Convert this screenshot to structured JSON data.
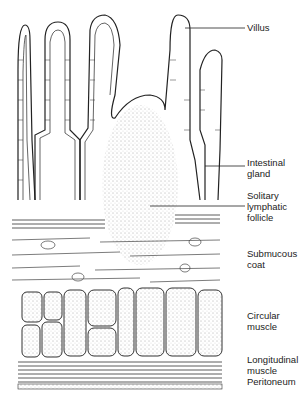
{
  "figure": {
    "labels": [
      {
        "id": "villus",
        "text": "Villus",
        "x": 247,
        "y": 24
      },
      {
        "id": "intestinal-gland",
        "text": "Intestinal\ngland",
        "x": 247,
        "y": 158
      },
      {
        "id": "solitary-lymphatic-follicle",
        "text": "Solitary\nlymphatic\nfollicle",
        "x": 247,
        "y": 193
      },
      {
        "id": "submucous-coat",
        "text": "Submucous\ncoat",
        "x": 247,
        "y": 245
      },
      {
        "id": "circular-muscle",
        "text": "Circular\nmuscle",
        "x": 247,
        "y": 310
      },
      {
        "id": "longitudinal-muscle",
        "text": "Longitudinal\nmuscle",
        "x": 247,
        "y": 355
      },
      {
        "id": "peritoneum",
        "text": "Peritoneum",
        "x": 247,
        "y": 377
      }
    ]
  }
}
